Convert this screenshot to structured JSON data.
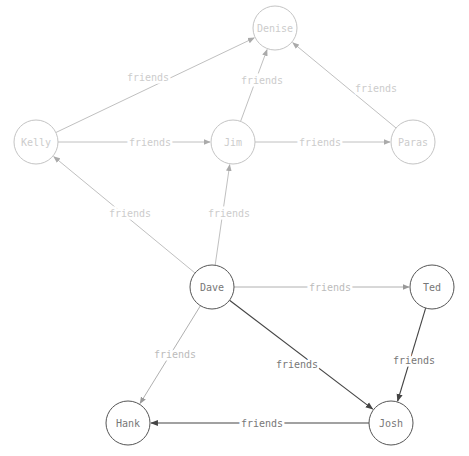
{
  "graph": {
    "node_radius": 22,
    "nodes": [
      {
        "id": "denise",
        "label": "Denise",
        "x": 275,
        "y": 28,
        "faded": true
      },
      {
        "id": "kelly",
        "label": "Kelly",
        "x": 36,
        "y": 142,
        "faded": true
      },
      {
        "id": "jim",
        "label": "Jim",
        "x": 233,
        "y": 142,
        "faded": true
      },
      {
        "id": "paras",
        "label": "Paras",
        "x": 413,
        "y": 142,
        "faded": true
      },
      {
        "id": "dave",
        "label": "Dave",
        "x": 212,
        "y": 287,
        "faded": false
      },
      {
        "id": "ted",
        "label": "Ted",
        "x": 432,
        "y": 287,
        "faded": false
      },
      {
        "id": "hank",
        "label": "Hank",
        "x": 128,
        "y": 423,
        "faded": false
      },
      {
        "id": "josh",
        "label": "Josh",
        "x": 391,
        "y": 423,
        "faded": false
      }
    ],
    "edges": [
      {
        "from": "kelly",
        "to": "denise",
        "label": "friends",
        "style": "faint",
        "lx": 148,
        "ly": 77
      },
      {
        "from": "kelly",
        "to": "jim",
        "label": "friends",
        "style": "faint",
        "lx": 150,
        "ly": 142
      },
      {
        "from": "jim",
        "to": "denise",
        "label": "friends",
        "style": "faint",
        "lx": 262,
        "ly": 80
      },
      {
        "from": "jim",
        "to": "paras",
        "label": "friends",
        "style": "faint",
        "lx": 320,
        "ly": 142
      },
      {
        "from": "paras",
        "to": "denise",
        "label": "friends",
        "style": "faint",
        "lx": 376,
        "ly": 88
      },
      {
        "from": "dave",
        "to": "kelly",
        "label": "friends",
        "style": "faint",
        "lx": 130,
        "ly": 213
      },
      {
        "from": "dave",
        "to": "jim",
        "label": "friends",
        "style": "faint",
        "lx": 229,
        "ly": 213
      },
      {
        "from": "dave",
        "to": "ted",
        "label": "friends",
        "style": "light",
        "lx": 330,
        "ly": 287
      },
      {
        "from": "dave",
        "to": "hank",
        "label": "friends",
        "style": "light",
        "lx": 175,
        "ly": 354
      },
      {
        "from": "dave",
        "to": "josh",
        "label": "friends",
        "style": "dark",
        "lx": 297,
        "ly": 364
      },
      {
        "from": "ted",
        "to": "josh",
        "label": "friends",
        "style": "dark",
        "lx": 414,
        "ly": 360
      },
      {
        "from": "josh",
        "to": "hank",
        "label": "friends",
        "style": "dark",
        "lx": 262,
        "ly": 423
      }
    ],
    "colors": {
      "background": "#ffffff",
      "node_stroke_dark": "#555555",
      "node_stroke_faded": "#c4c4c4",
      "node_text_dark": "#777777",
      "node_text_faded": "#cccccc",
      "edge_dark": "#444444",
      "edge_light": "#b0b0b0",
      "edge_faint": "#c0c0c0",
      "label_dark": "#777777",
      "label_light": "#bbbbbb",
      "label_faint": "#cccccc"
    }
  }
}
